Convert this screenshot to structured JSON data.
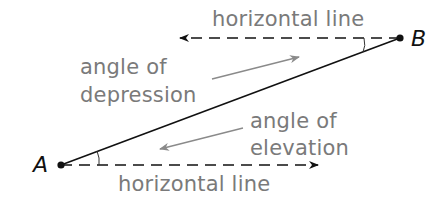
{
  "diagram": {
    "points": [
      {
        "id": "A",
        "label": "A",
        "x": 61,
        "y": 165
      },
      {
        "id": "B",
        "label": "B",
        "x": 400,
        "y": 38
      }
    ],
    "labels": {
      "top_horizontal": "horizontal line",
      "bottom_horizontal": "horizontal line",
      "depression_line1": "angle of",
      "depression_line2": "depression",
      "elevation_line1": "angle of",
      "elevation_line2": "elevation"
    },
    "colors": {
      "line": "#111111",
      "label_text": "#7a7a7a",
      "pointer_arrow": "#8a8a8a"
    }
  }
}
